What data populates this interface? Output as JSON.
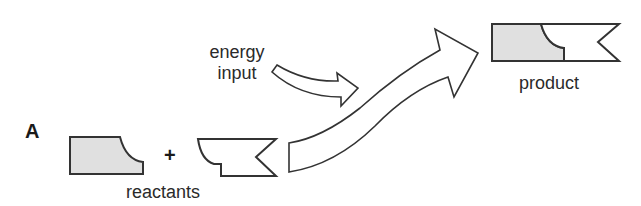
{
  "figure": {
    "panel_label": "A",
    "labels": {
      "energy_line1": "energy",
      "energy_line2": "input",
      "reactants": "reactants",
      "product": "product",
      "plus": "+"
    },
    "colors": {
      "stroke": "#333333",
      "fill_shaded": "#e0e0e0",
      "fill_white": "#ffffff"
    }
  }
}
